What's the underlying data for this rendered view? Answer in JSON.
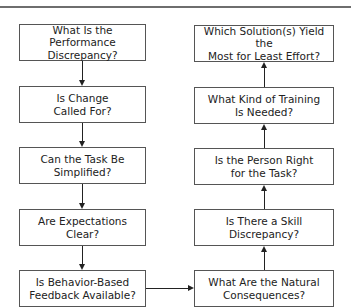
{
  "diagram": {
    "type": "flowchart",
    "left_column": [
      {
        "line1": "What Is the Performance",
        "line2": "Discrepancy?"
      },
      {
        "line1": "Is Change",
        "line2": "Called For?"
      },
      {
        "line1": "Can the Task Be",
        "line2": "Simplified?"
      },
      {
        "line1": "Are Expectations",
        "line2": "Clear?"
      },
      {
        "line1": "Is Behavior-Based",
        "line2": "Feedback Available?"
      }
    ],
    "right_column": [
      {
        "line1": "Which Solution(s) Yield the",
        "line2": "Most for Least Effort?"
      },
      {
        "line1": "What Kind of Training",
        "line2": "Is Needed?"
      },
      {
        "line1": "Is the Person Right",
        "line2": "for the Task?"
      },
      {
        "line1": "Is There a Skill",
        "line2": "Discrepancy?"
      },
      {
        "line1": "What Are the Natural",
        "line2": "Consequences?"
      }
    ],
    "flow": "Left column flows downward; bottom-left connects right to bottom-right; right column flows upward."
  }
}
